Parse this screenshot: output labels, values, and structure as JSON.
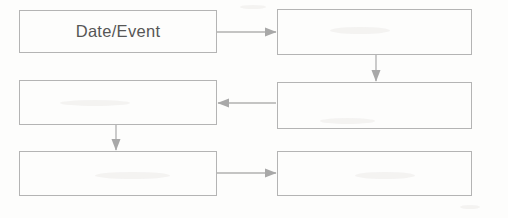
{
  "diagram": {
    "type": "flowchart",
    "title": "",
    "background_color": "#fdfdfc",
    "line_color": "#b4b4b4",
    "text_color": "#565656",
    "nodes": [
      {
        "id": "n1",
        "label": "Date/Event",
        "row": 1,
        "column": "left",
        "x": 19,
        "y": 10,
        "width": 198,
        "height": 43
      },
      {
        "id": "n2",
        "label": "",
        "row": 1,
        "column": "right",
        "x": 277,
        "y": 9,
        "width": 195,
        "height": 46
      },
      {
        "id": "n3",
        "label": "",
        "row": 2,
        "column": "left",
        "x": 19,
        "y": 80,
        "width": 198,
        "height": 45
      },
      {
        "id": "n4",
        "label": "",
        "row": 2,
        "column": "right",
        "x": 277,
        "y": 82,
        "width": 195,
        "height": 47
      },
      {
        "id": "n5",
        "label": "",
        "row": 3,
        "column": "left",
        "x": 19,
        "y": 151,
        "width": 198,
        "height": 45
      },
      {
        "id": "n6",
        "label": "",
        "row": 3,
        "column": "right",
        "x": 277,
        "y": 151,
        "width": 195,
        "height": 45
      }
    ],
    "connectors": [
      {
        "id": "c1",
        "from": "n1",
        "to": "n2",
        "direction": "right"
      },
      {
        "id": "c2",
        "from": "n2",
        "to": "n4",
        "direction": "down"
      },
      {
        "id": "c3",
        "from": "n4",
        "to": "n3",
        "direction": "left"
      },
      {
        "id": "c4",
        "from": "n3",
        "to": "n5",
        "direction": "down"
      },
      {
        "id": "c5",
        "from": "n5",
        "to": "n6",
        "direction": "right"
      }
    ]
  }
}
